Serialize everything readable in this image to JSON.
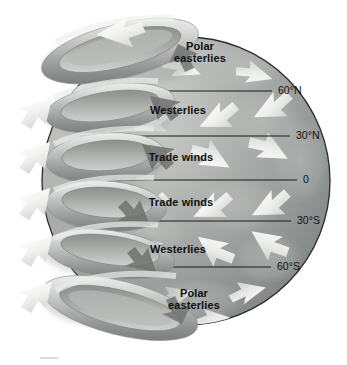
{
  "figure": {
    "type": "diagram",
    "colors": {
      "background": "#ffffff",
      "globe_light": "#c9cbc9",
      "globe_mid": "#9fa3a2",
      "globe_dark": "#7c817f",
      "globe_outline": "#2b2b2b",
      "cell_light": "#e3e4e2",
      "cell_mid": "#b2b5b3",
      "cell_dark": "#80847f",
      "arrow_white": "#f6f7f5",
      "arrow_shadow": "#6e726f",
      "text": "#111111",
      "latitude_line": "#1a1a1a"
    },
    "wind_bands": [
      {
        "id": "polar-easterlies-north",
        "label_line1": "Polar",
        "label_line2": "easterlies",
        "hemisphere": "north",
        "lat_range": "60°N–90°N",
        "arrow_direction": "southwest",
        "cx": 200,
        "cy": 56
      },
      {
        "id": "westerlies-north",
        "label_line1": "Westerlies",
        "label_line2": "",
        "hemisphere": "north",
        "lat_range": "30°N–60°N",
        "arrow_direction": "northeast",
        "cx": 178,
        "cy": 110
      },
      {
        "id": "trade-winds-north",
        "label_line1": "Trade winds",
        "label_line2": "",
        "hemisphere": "north",
        "lat_range": "0–30°N",
        "arrow_direction": "southwest",
        "cx": 180,
        "cy": 156
      },
      {
        "id": "trade-winds-south",
        "label_line1": "Trade winds",
        "label_line2": "",
        "hemisphere": "south",
        "lat_range": "0–30°S",
        "arrow_direction": "northeast",
        "cx": 180,
        "cy": 202
      },
      {
        "id": "westerlies-south",
        "label_line1": "Westerlies",
        "label_line2": "",
        "hemisphere": "south",
        "lat_range": "30°S–60°S",
        "arrow_direction": "southeast",
        "cx": 180,
        "cy": 249
      },
      {
        "id": "polar-easterlies-south",
        "label_line1": "Polar",
        "label_line2": "easterlies",
        "hemisphere": "south",
        "lat_range": "60°S–90°S",
        "arrow_direction": "northwest",
        "cx": 196,
        "cy": 299
      }
    ],
    "latitudes": [
      {
        "id": "lat-60n",
        "label": "60°N",
        "y": 91,
        "line_x1": 94,
        "line_x2": 272,
        "text_x": 278
      },
      {
        "id": "lat-30n",
        "label": "30°N",
        "y": 136,
        "line_x1": 80,
        "line_x2": 290,
        "text_x": 296
      },
      {
        "id": "lat-0",
        "label": "0",
        "y": 180,
        "line_x1": 74,
        "line_x2": 297,
        "text_x": 303
      },
      {
        "id": "lat-30s",
        "label": "30°S",
        "y": 221,
        "line_x1": 79,
        "line_x2": 291,
        "text_x": 297
      },
      {
        "id": "lat-60s",
        "label": "60°S",
        "y": 267,
        "line_x1": 95,
        "line_x2": 271,
        "text_x": 277
      }
    ],
    "circulation_cells": [
      {
        "id": "cell-polar-north",
        "name": "Polar cell (north)",
        "cy": 58,
        "rx": 78,
        "ry": 26,
        "flow": "clockwise"
      },
      {
        "id": "cell-ferrel-north",
        "name": "Ferrel cell (north)",
        "cy": 112,
        "rx": 66,
        "ry": 24,
        "flow": "counterclockwise"
      },
      {
        "id": "cell-hadley-north",
        "name": "Hadley cell (north)",
        "cy": 160,
        "rx": 62,
        "ry": 26,
        "flow": "clockwise"
      },
      {
        "id": "cell-hadley-south",
        "name": "Hadley cell (south)",
        "cy": 204,
        "rx": 62,
        "ry": 26,
        "flow": "counterclockwise"
      },
      {
        "id": "cell-ferrel-south",
        "name": "Ferrel cell (south)",
        "cy": 252,
        "rx": 66,
        "ry": 24,
        "flow": "clockwise"
      },
      {
        "id": "cell-polar-south",
        "name": "Polar cell (south)",
        "cy": 305,
        "rx": 78,
        "ry": 26,
        "flow": "counterclockwise"
      }
    ],
    "globe": {
      "cx": 186,
      "cy": 181,
      "r": 144
    }
  }
}
